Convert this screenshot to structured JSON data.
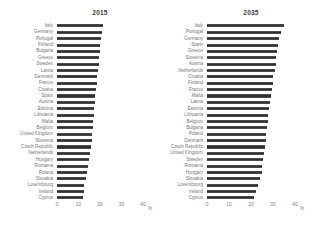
{
  "figure": {
    "background": "#ffffff",
    "bar_color": "#3d3d3d",
    "label_color": "#767676",
    "title_color": "#3c3c3c"
  },
  "chart_data": [
    {
      "type": "bar",
      "orientation": "horizontal",
      "title": "2015",
      "xlabel": "%",
      "xlim": [
        0,
        40
      ],
      "xticks": [
        0,
        10,
        20,
        30,
        40
      ],
      "grid": false,
      "legend": false,
      "categories": [
        "Italy",
        "Germany",
        "Portugal",
        "Finland",
        "Bulgaria",
        "Greece",
        "Sweden",
        "Latvia",
        "Denmark",
        "France",
        "Croatia",
        "Spain",
        "Austria",
        "Estonia",
        "Lithuania",
        "Malta",
        "Belgium",
        "United Kingdom",
        "Slovenia",
        "Czech Republic",
        "Netherlands",
        "Hungary",
        "Romania",
        "Poland",
        "Slovakia",
        "Luxembourg",
        "Ireland",
        "Cyprus"
      ],
      "values": [
        21.5,
        21.0,
        20.3,
        20.1,
        19.9,
        19.5,
        19.3,
        19.1,
        18.7,
        18.5,
        18.1,
        17.8,
        17.7,
        17.3,
        17.2,
        16.9,
        16.6,
        16.4,
        16.1,
        15.8,
        15.5,
        15.0,
        14.6,
        14.0,
        13.3,
        12.7,
        12.4,
        12.2
      ]
    },
    {
      "type": "bar",
      "orientation": "horizontal",
      "title": "2035",
      "xlabel": "%",
      "xlim": [
        0,
        40
      ],
      "xticks": [
        0,
        10,
        20,
        30,
        40
      ],
      "grid": false,
      "legend": false,
      "categories": [
        "Italy",
        "Portugal",
        "Germany",
        "Spain",
        "Greece",
        "Slovenia",
        "Austria",
        "Netherlands",
        "Croatia",
        "Finland",
        "France",
        "Malta",
        "Latvia",
        "Estonia",
        "Lithuania",
        "Belgium",
        "Bulgaria",
        "Poland",
        "Denmark",
        "Czech Republic",
        "United Kingdom",
        "Sweden",
        "Romania",
        "Hungary",
        "Slovakia",
        "Luxembourg",
        "Ireland",
        "Cyprus"
      ],
      "values": [
        35.0,
        33.6,
        32.8,
        32.4,
        32.0,
        31.5,
        31.2,
        30.9,
        30.2,
        29.8,
        29.4,
        29.0,
        28.6,
        28.3,
        27.9,
        27.6,
        27.3,
        27.0,
        26.6,
        26.3,
        26.0,
        25.6,
        25.1,
        24.8,
        24.0,
        23.0,
        22.1,
        21.4
      ]
    }
  ]
}
